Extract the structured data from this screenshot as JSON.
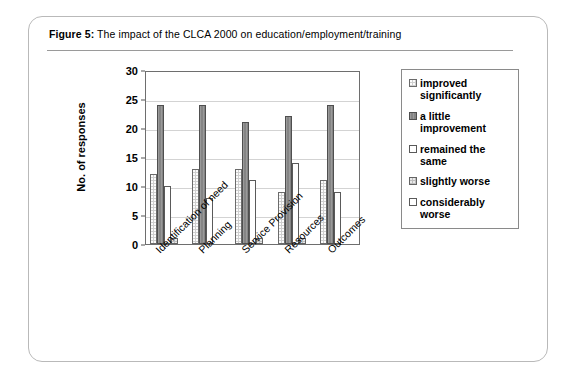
{
  "figure": {
    "label": "Figure 5:",
    "caption": "The impact of the CLCA 2000 on education/employment/training"
  },
  "chart_data": {
    "type": "bar",
    "title": "",
    "xlabel": "",
    "ylabel": "No. of responses",
    "ylim": [
      0,
      30
    ],
    "yticks": [
      0,
      5,
      10,
      15,
      20,
      25,
      30
    ],
    "grid": true,
    "legend_position": "right",
    "categories": [
      "Identification of need",
      "Planning",
      "Service Provision",
      "Resources",
      "Outcomes"
    ],
    "series": [
      {
        "name": "improved significantly",
        "color": "#cfcfcf",
        "values": [
          12,
          13,
          13,
          9,
          11
        ]
      },
      {
        "name": "a little improvement",
        "color": "#8f8f8f",
        "values": [
          24,
          24,
          21,
          22,
          24
        ]
      },
      {
        "name": "remained the same",
        "color": "#ffffff",
        "values": [
          10,
          8,
          11,
          14,
          9
        ]
      },
      {
        "name": "slightly worse",
        "color": "#bdbdbd",
        "values": [
          1,
          0,
          1,
          1,
          0
        ]
      },
      {
        "name": "considerably worse",
        "color": "#ffffff",
        "values": [
          0,
          0,
          0,
          0,
          0
        ]
      }
    ]
  },
  "legend": {
    "items": [
      {
        "label": "improved significantly"
      },
      {
        "label": "a little improvement"
      },
      {
        "label": "remained the same"
      },
      {
        "label": "slightly worse"
      },
      {
        "label": "considerably worse"
      }
    ]
  }
}
